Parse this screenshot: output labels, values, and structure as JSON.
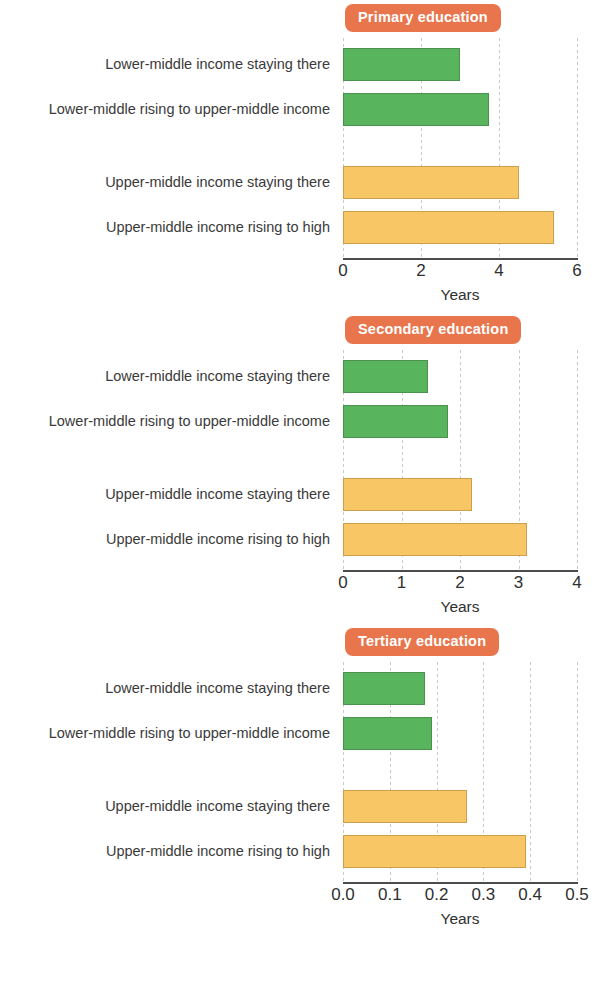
{
  "figure": {
    "categories": [
      "Lower-middle income staying there",
      "Lower-middle rising to upper-middle income",
      "Upper-middle income staying there",
      "Upper-middle income rising to high"
    ],
    "colors": {
      "lower_middle_bar": "#58b55e",
      "upper_middle_bar": "#f9c666",
      "badge": "#e8754c",
      "axis": "#4b4b4b",
      "gridline": "#c9c9c9"
    },
    "axis_title": "Years"
  },
  "chart_data": [
    {
      "type": "bar",
      "title": "Primary education",
      "orientation": "horizontal",
      "xlabel": "Years",
      "ylabel": "",
      "xlim": [
        0,
        6
      ],
      "xticks": [
        "0",
        "2",
        "4",
        "6"
      ],
      "xtick_values": [
        0,
        2,
        4,
        6
      ],
      "grid": true,
      "legend": "none",
      "categories": [
        "Lower-middle income staying there",
        "Lower-middle rising to upper-middle income",
        "Upper-middle income staying there",
        "Upper-middle income rising to high"
      ],
      "values": [
        3.0,
        3.75,
        4.5,
        5.4
      ],
      "bar_colors": [
        "#58b55e",
        "#58b55e",
        "#f9c666",
        "#f9c666"
      ]
    },
    {
      "type": "bar",
      "title": "Secondary education",
      "orientation": "horizontal",
      "xlabel": "Years",
      "ylabel": "",
      "xlim": [
        0,
        4
      ],
      "xticks": [
        "0",
        "1",
        "2",
        "3",
        "4"
      ],
      "xtick_values": [
        0,
        1,
        2,
        3,
        4
      ],
      "grid": true,
      "legend": "none",
      "categories": [
        "Lower-middle income staying there",
        "Lower-middle rising to upper-middle income",
        "Upper-middle income staying there",
        "Upper-middle income rising to high"
      ],
      "values": [
        1.45,
        1.8,
        2.2,
        3.15
      ],
      "bar_colors": [
        "#58b55e",
        "#58b55e",
        "#f9c666",
        "#f9c666"
      ]
    },
    {
      "type": "bar",
      "title": "Tertiary education",
      "orientation": "horizontal",
      "xlabel": "Years",
      "ylabel": "",
      "xlim": [
        0,
        0.5
      ],
      "xticks": [
        "0.0",
        "0.1",
        "0.2",
        "0.3",
        "0.4",
        "0.5"
      ],
      "xtick_values": [
        0,
        0.1,
        0.2,
        0.3,
        0.4,
        0.5
      ],
      "grid": true,
      "legend": "none",
      "categories": [
        "Lower-middle income staying there",
        "Lower-middle rising to upper-middle income",
        "Upper-middle income staying there",
        "Upper-middle income rising to high"
      ],
      "values": [
        0.175,
        0.19,
        0.265,
        0.39
      ],
      "bar_colors": [
        "#58b55e",
        "#58b55e",
        "#f9c666",
        "#f9c666"
      ]
    }
  ]
}
